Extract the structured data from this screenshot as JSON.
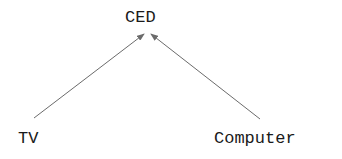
{
  "diagram": {
    "type": "directed-graph",
    "nodes": [
      {
        "id": "ced",
        "label": "CED"
      },
      {
        "id": "tv",
        "label": "TV"
      },
      {
        "id": "computer",
        "label": "Computer"
      }
    ],
    "edges": [
      {
        "from": "tv",
        "to": "ced"
      },
      {
        "from": "computer",
        "to": "ced"
      }
    ],
    "colors": {
      "text": "#1a1a1a",
      "edge": "#6b6b6b",
      "background": "#ffffff"
    }
  }
}
